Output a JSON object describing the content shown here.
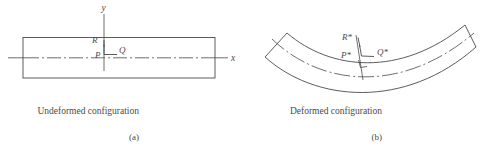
{
  "figure": {
    "panels": [
      {
        "id": "a",
        "caption": "Undeformed configuration",
        "subcaption": "(a)",
        "axes": {
          "y_label": "y",
          "x_label": "x"
        },
        "points": [
          {
            "name": "R",
            "label": "R"
          },
          {
            "name": "P",
            "label": "P"
          },
          {
            "name": "Q",
            "label": "Q"
          }
        ]
      },
      {
        "id": "b",
        "caption": "Deformed configuration",
        "subcaption": "(b)",
        "points": [
          {
            "name": "R-star",
            "label": "R*"
          },
          {
            "name": "P-star",
            "label": "P*"
          },
          {
            "name": "Q-star",
            "label": "Q*"
          }
        ]
      }
    ],
    "style": {
      "line_color": "#4a4a4a",
      "centerline_color": "#555555",
      "background": "#ffffff"
    }
  }
}
